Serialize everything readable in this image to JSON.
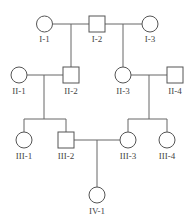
{
  "diagram": {
    "type": "pedigree",
    "colors": {
      "line": "#666666",
      "shape_stroke": "#555555",
      "shape_fill": "#ffffff",
      "label": "#444444"
    },
    "generations": [
      "I",
      "II",
      "III",
      "IV"
    ],
    "individuals": [
      {
        "id": "I-1",
        "label": "I-1",
        "sex": "female",
        "affected": false
      },
      {
        "id": "I-2",
        "label": "I-2",
        "sex": "male",
        "affected": false
      },
      {
        "id": "I-3",
        "label": "I-3",
        "sex": "female",
        "affected": false
      },
      {
        "id": "II-1",
        "label": "II-1",
        "sex": "female",
        "affected": false
      },
      {
        "id": "II-2",
        "label": "II-2",
        "sex": "male",
        "affected": false
      },
      {
        "id": "II-3",
        "label": "II-3",
        "sex": "female",
        "affected": false
      },
      {
        "id": "II-4",
        "label": "II-4",
        "sex": "male",
        "affected": false
      },
      {
        "id": "III-1",
        "label": "III-1",
        "sex": "female",
        "affected": false
      },
      {
        "id": "III-2",
        "label": "III-2",
        "sex": "male",
        "affected": false
      },
      {
        "id": "III-3",
        "label": "III-3",
        "sex": "female",
        "affected": false
      },
      {
        "id": "III-4",
        "label": "III-4",
        "sex": "female",
        "affected": false
      },
      {
        "id": "IV-1",
        "label": "IV-1",
        "sex": "female",
        "affected": false
      }
    ],
    "unions": [
      {
        "partners": [
          "I-1",
          "I-2"
        ],
        "children": [
          "II-2"
        ]
      },
      {
        "partners": [
          "I-2",
          "I-3"
        ],
        "children": [
          "II-3"
        ]
      },
      {
        "partners": [
          "II-1",
          "II-2"
        ],
        "children": [
          "III-1",
          "III-2"
        ]
      },
      {
        "partners": [
          "II-3",
          "II-4"
        ],
        "children": [
          "III-3",
          "III-4"
        ]
      },
      {
        "partners": [
          "III-2",
          "III-3"
        ],
        "children": [
          "IV-1"
        ]
      }
    ]
  }
}
